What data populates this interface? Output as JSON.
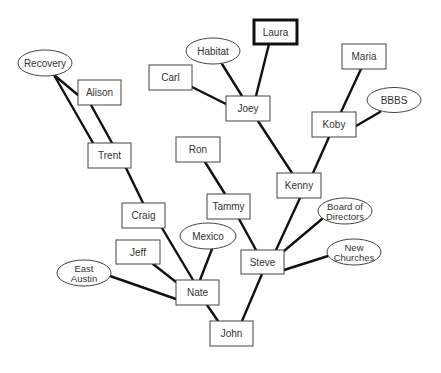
{
  "diagram": {
    "title": "",
    "colors": {
      "line": "#111111",
      "box_stroke": "#444444",
      "text": "#333333",
      "background": "#ffffff"
    },
    "nodes": [
      {
        "id": "laura",
        "label": "Laura",
        "shape": "rect",
        "x": 254,
        "y": 20,
        "w": 43,
        "h": 24,
        "emphasis": true
      },
      {
        "id": "habitat",
        "label": "Habitat",
        "shape": "ellipse",
        "cx": 213,
        "cy": 51,
        "rx": 27,
        "ry": 13
      },
      {
        "id": "carl",
        "label": "Carl",
        "shape": "rect",
        "x": 149,
        "y": 65,
        "w": 43,
        "h": 25
      },
      {
        "id": "joey",
        "label": "Joey",
        "shape": "rect",
        "x": 226,
        "y": 96,
        "w": 44,
        "h": 25
      },
      {
        "id": "maria",
        "label": "Maria",
        "shape": "rect",
        "x": 342,
        "y": 44,
        "w": 44,
        "h": 25
      },
      {
        "id": "bbbs",
        "label": "BBBS",
        "shape": "ellipse",
        "cx": 394,
        "cy": 100,
        "rx": 27,
        "ry": 12.5
      },
      {
        "id": "koby",
        "label": "Koby",
        "shape": "rect",
        "x": 312,
        "y": 112,
        "w": 44,
        "h": 25
      },
      {
        "id": "kenny",
        "label": "Kenny",
        "shape": "rect",
        "x": 277,
        "y": 173,
        "w": 44,
        "h": 25
      },
      {
        "id": "recovery",
        "label": "Recovery",
        "shape": "ellipse",
        "cx": 45,
        "cy": 63,
        "rx": 27,
        "ry": 13
      },
      {
        "id": "alison",
        "label": "Alison",
        "shape": "rect",
        "x": 78,
        "y": 80,
        "w": 43,
        "h": 25
      },
      {
        "id": "trent",
        "label": "Trent",
        "shape": "rect",
        "x": 88,
        "y": 143,
        "w": 43,
        "h": 25
      },
      {
        "id": "ron",
        "label": "Ron",
        "shape": "rect",
        "x": 176,
        "y": 137,
        "w": 44,
        "h": 25
      },
      {
        "id": "tammy",
        "label": "Tammy",
        "shape": "rect",
        "x": 207,
        "y": 194,
        "w": 43,
        "h": 25
      },
      {
        "id": "craig",
        "label": "Craig",
        "shape": "rect",
        "x": 122,
        "y": 203,
        "w": 43,
        "h": 25
      },
      {
        "id": "mexico",
        "label": "Mexico",
        "shape": "ellipse",
        "cx": 208,
        "cy": 236,
        "rx": 28,
        "ry": 13
      },
      {
        "id": "jeff",
        "label": "Jeff",
        "shape": "rect",
        "x": 116,
        "y": 240,
        "w": 44,
        "h": 24
      },
      {
        "id": "east_austin",
        "label": [
          "East",
          "Austin"
        ],
        "shape": "ellipse",
        "cx": 84,
        "cy": 273,
        "rx": 27,
        "ry": 13
      },
      {
        "id": "nate",
        "label": "Nate",
        "shape": "rect",
        "x": 176,
        "y": 280,
        "w": 43,
        "h": 25
      },
      {
        "id": "steve",
        "label": "Steve",
        "shape": "rect",
        "x": 241,
        "y": 250,
        "w": 43,
        "h": 24
      },
      {
        "id": "board",
        "label": [
          "Board of",
          "Directors"
        ],
        "shape": "ellipse",
        "cx": 345,
        "cy": 211,
        "rx": 27,
        "ry": 13
      },
      {
        "id": "new_churches",
        "label": [
          "New",
          "Churches"
        ],
        "shape": "ellipse",
        "cx": 354,
        "cy": 252,
        "rx": 27,
        "ry": 13
      },
      {
        "id": "john",
        "label": "John",
        "shape": "rect",
        "x": 210,
        "y": 321,
        "w": 43,
        "h": 25
      }
    ],
    "edges": [
      {
        "from": "laura",
        "to": "joey",
        "x1": 269,
        "y1": 44,
        "x2": 256,
        "y2": 96
      },
      {
        "from": "habitat",
        "to": "joey",
        "x1": 222,
        "y1": 64,
        "x2": 242,
        "y2": 96
      },
      {
        "from": "carl",
        "to": "joey",
        "x1": 192,
        "y1": 87,
        "x2": 226,
        "y2": 104
      },
      {
        "from": "joey",
        "to": "kenny",
        "x1": 258,
        "y1": 121,
        "x2": 292,
        "y2": 173
      },
      {
        "from": "maria",
        "to": "koby",
        "x1": 361,
        "y1": 69,
        "x2": 341,
        "y2": 112
      },
      {
        "from": "bbbs",
        "to": "koby",
        "x1": 380,
        "y1": 112,
        "x2": 356,
        "y2": 126
      },
      {
        "from": "koby",
        "to": "kenny",
        "x1": 329,
        "y1": 137,
        "x2": 313,
        "y2": 173
      },
      {
        "from": "kenny",
        "to": "steve",
        "x1": 300,
        "y1": 198,
        "x2": 276,
        "y2": 250
      },
      {
        "from": "recovery",
        "to": "alison",
        "x1": 54,
        "y1": 75,
        "x2": 78,
        "y2": 95
      },
      {
        "from": "recovery",
        "to": "trent",
        "x1": 54,
        "y1": 75,
        "x2": 93,
        "y2": 143
      },
      {
        "from": "alison",
        "to": "trent",
        "x1": 91,
        "y1": 105,
        "x2": 112,
        "y2": 143
      },
      {
        "from": "trent",
        "to": "craig",
        "x1": 126,
        "y1": 168,
        "x2": 143,
        "y2": 203
      },
      {
        "from": "ron",
        "to": "tammy",
        "x1": 205,
        "y1": 162,
        "x2": 225,
        "y2": 194
      },
      {
        "from": "tammy",
        "to": "steve",
        "x1": 239,
        "y1": 219,
        "x2": 256,
        "y2": 250
      },
      {
        "from": "craig",
        "to": "nate",
        "x1": 162,
        "y1": 228,
        "x2": 193,
        "y2": 280
      },
      {
        "from": "mexico",
        "to": "nate",
        "x1": 212,
        "y1": 249,
        "x2": 200,
        "y2": 280
      },
      {
        "from": "jeff",
        "to": "nate",
        "x1": 153,
        "y1": 264,
        "x2": 176,
        "y2": 282
      },
      {
        "from": "east_austin",
        "to": "nate",
        "x1": 110,
        "y1": 276,
        "x2": 176,
        "y2": 299
      },
      {
        "from": "board",
        "to": "steve",
        "x1": 322,
        "y1": 219,
        "x2": 284,
        "y2": 251
      },
      {
        "from": "new_churches",
        "to": "steve",
        "x1": 328,
        "y1": 256,
        "x2": 284,
        "y2": 270
      },
      {
        "from": "nate",
        "to": "john",
        "x1": 207,
        "y1": 305,
        "x2": 218,
        "y2": 321
      },
      {
        "from": "steve",
        "to": "john",
        "x1": 262,
        "y1": 274,
        "x2": 242,
        "y2": 321
      }
    ]
  }
}
